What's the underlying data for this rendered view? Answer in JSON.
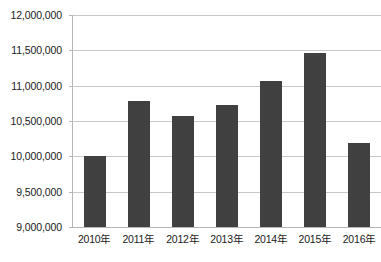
{
  "chart_data": {
    "type": "bar",
    "title": "",
    "subtitle": "",
    "xlabel": "",
    "ylabel": "",
    "categories": [
      "2010年",
      "2011年",
      "2012年",
      "2013年",
      "2014年",
      "2015年",
      "2016年"
    ],
    "values": [
      10010000,
      10790000,
      10570000,
      10730000,
      11060000,
      11460000,
      10190000
    ],
    "series": [
      {
        "name": "",
        "values": [
          10010000,
          10790000,
          10570000,
          10730000,
          11060000,
          11460000,
          10190000
        ]
      }
    ],
    "ylim": [
      9000000,
      12000000
    ],
    "ytick_values": [
      9000000,
      9500000,
      10000000,
      10500000,
      11000000,
      11500000,
      12000000
    ],
    "ytick_labels": [
      "9,000,000",
      "9,500,000",
      "10,000,000",
      "10,500,000",
      "11,000,000",
      "11,500,000",
      "12,000,000"
    ],
    "grid": true,
    "legend": false,
    "legend_position": "none",
    "bar_color": "#404040",
    "grid_color": "#c8c8c8",
    "axis_color": "#b6b6b6",
    "text_color": "#1a1a1a",
    "annotations": []
  }
}
